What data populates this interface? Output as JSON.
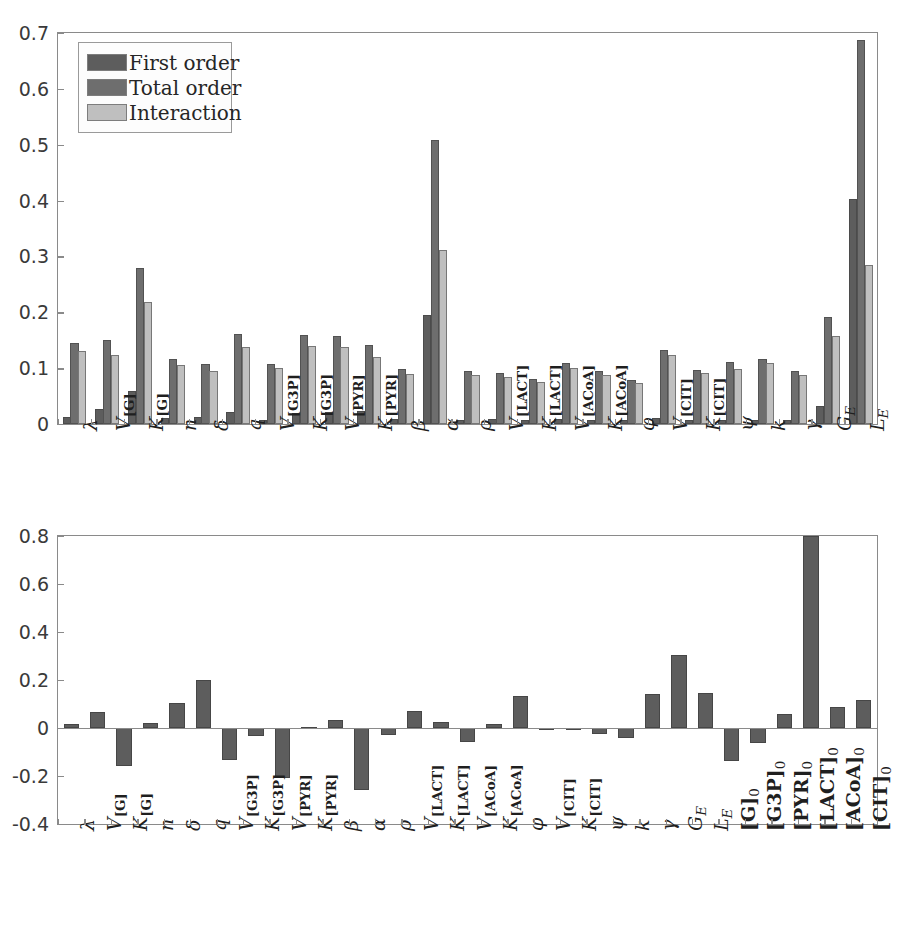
{
  "figure": {
    "background": "#ffffff",
    "colors": {
      "first_order": "#5d5d5d",
      "total_order": "#6e6e6e",
      "interaction": "#bfbfbf",
      "single_series": "#5d5d5d",
      "axis": "#8a8a8a",
      "text": "#262626"
    }
  },
  "chart_data": [
    {
      "id": "sobol-indices",
      "type": "bar",
      "title": "",
      "subtitle": "",
      "xlabel": "",
      "ylabel": "",
      "ylim": [
        0,
        0.7
      ],
      "yticks": [
        0,
        0.1,
        0.2,
        0.3,
        0.4,
        0.5,
        0.6,
        0.7
      ],
      "ytick_labels": [
        "0",
        "0.1",
        "0.2",
        "0.3",
        "0.4",
        "0.5",
        "0.6",
        "0.7"
      ],
      "grid": false,
      "legend_position": "top-left",
      "legend": [
        "First order",
        "Total order",
        "Interaction"
      ],
      "categories": [
        "lambda",
        "V_G",
        "K_G",
        "n",
        "delta",
        "q",
        "V_G3P",
        "K_G3P",
        "V_PYR",
        "K_PYR",
        "beta",
        "alpha",
        "rho",
        "V_LACT",
        "K_LACT",
        "V_ACoA",
        "K_ACoA",
        "phi",
        "V_CIT",
        "K_CIT",
        "psi",
        "k",
        "gamma",
        "G_E",
        "L_E"
      ],
      "category_labels": [
        "λ",
        "V[G]",
        "K[G]",
        "n",
        "δ",
        "q",
        "V[G3P]",
        "K[G3P]",
        "V[PYR]",
        "K[PYR]",
        "β",
        "α",
        "ρ",
        "V[LACT]",
        "K[LACT]",
        "V[ACoA]",
        "K[ACoA]",
        "φ",
        "V[CIT]",
        "K[CIT]",
        "ψ",
        "k",
        "γ",
        "G_E",
        "L_E"
      ],
      "series": [
        {
          "name": "First order",
          "color": "#5d5d5d",
          "values": [
            0.013,
            0.026,
            0.059,
            0.01,
            0.012,
            0.022,
            0.008,
            0.019,
            0.021,
            0.023,
            0.009,
            0.195,
            0.008,
            0.009,
            0.008,
            0.009,
            0.008,
            0.007,
            0.01,
            0.008,
            0.008,
            0.007,
            0.007,
            0.032,
            0.403
          ]
        },
        {
          "name": "Total order",
          "color": "#6e6e6e",
          "values": [
            0.145,
            0.151,
            0.279,
            0.117,
            0.108,
            0.162,
            0.108,
            0.16,
            0.157,
            0.142,
            0.098,
            0.508,
            0.095,
            0.092,
            0.081,
            0.11,
            0.095,
            0.079,
            0.133,
            0.097,
            0.111,
            0.117,
            0.094,
            0.192,
            0.687
          ]
        },
        {
          "name": "Interaction",
          "color": "#bfbfbf",
          "values": [
            0.131,
            0.124,
            0.219,
            0.105,
            0.095,
            0.138,
            0.1,
            0.14,
            0.137,
            0.12,
            0.09,
            0.312,
            0.088,
            0.084,
            0.075,
            0.1,
            0.088,
            0.073,
            0.124,
            0.091,
            0.099,
            0.11,
            0.087,
            0.158,
            0.285
          ]
        }
      ]
    },
    {
      "id": "regression-coefficients",
      "type": "bar",
      "title": "",
      "subtitle": "",
      "xlabel": "",
      "ylabel": "",
      "ylim": [
        -0.4,
        0.8
      ],
      "yticks": [
        -0.4,
        -0.2,
        0,
        0.2,
        0.4,
        0.6,
        0.8
      ],
      "ytick_labels": [
        "-0.4",
        "-0.2",
        "0",
        "0.2",
        "0.4",
        "0.6",
        "0.8"
      ],
      "grid": false,
      "legend_position": "none",
      "legend": [],
      "categories": [
        "lambda",
        "V_G",
        "K_G",
        "n",
        "delta",
        "q",
        "V_G3P",
        "K_G3P",
        "V_PYR",
        "K_PYR",
        "beta",
        "alpha",
        "rho",
        "V_LACT",
        "K_LACT",
        "V_ACoA",
        "K_ACoA",
        "phi",
        "V_CIT",
        "K_CIT",
        "psi",
        "k",
        "gamma",
        "G_E",
        "L_E",
        "G_0",
        "G3P_0",
        "PYR_0",
        "LACT_0",
        "ACoA_0",
        "CIT_0"
      ],
      "category_labels": [
        "λ",
        "V[G]",
        "K[G]",
        "n",
        "δ",
        "q",
        "V[G3P]",
        "K[G3P]",
        "V[PYR]",
        "K[PYR]",
        "β",
        "α",
        "ρ",
        "V[LACT]",
        "K[LACT]",
        "V[ACoA]",
        "K[ACoA]",
        "φ",
        "V[CIT]",
        "K[CIT]",
        "ψ",
        "k",
        "γ",
        "G_E",
        "L_E",
        "[G]0",
        "[G3P]0",
        "[PYR]0",
        "[LACT]0",
        "[ACoA]0",
        "[CIT]0"
      ],
      "series": [
        {
          "name": "Regression coefficient",
          "color": "#5d5d5d",
          "values": [
            0.018,
            0.068,
            -0.158,
            0.02,
            0.105,
            0.198,
            -0.133,
            -0.035,
            -0.209,
            0.003,
            0.033,
            -0.257,
            -0.028,
            0.072,
            0.025,
            -0.06,
            0.018,
            0.133,
            0.002,
            -0.007,
            -0.025,
            -0.042,
            0.142,
            0.305,
            0.147,
            -0.137,
            -0.063,
            0.06,
            0.8,
            0.088,
            0.118
          ]
        }
      ]
    }
  ]
}
